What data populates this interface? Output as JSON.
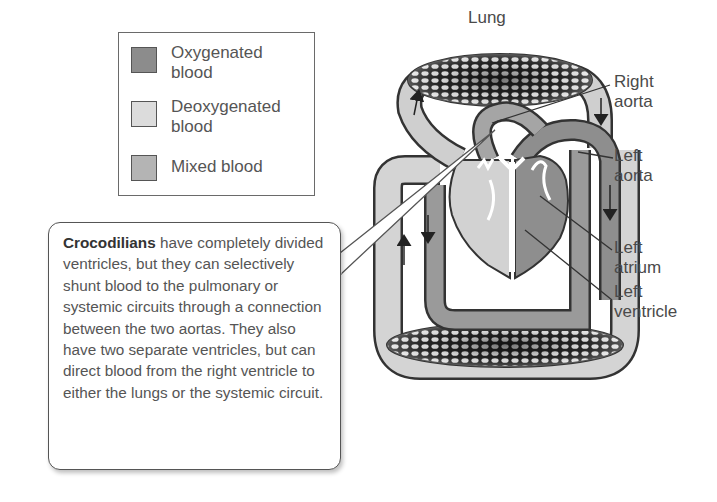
{
  "legend": {
    "items": [
      {
        "label": "Oxygenated blood",
        "line1": "Oxygenated",
        "line2": "blood",
        "color": "#8c8c8c"
      },
      {
        "label": "Deoxygenated blood",
        "line1": "Deoxygenated",
        "line2": "blood",
        "color": "#dcdcdc"
      },
      {
        "label": "Mixed blood",
        "line1": "Mixed blood",
        "line2": "",
        "color": "#b4b4b4"
      }
    ]
  },
  "diagram": {
    "lung_label": "Lung",
    "labels": {
      "right_aorta": {
        "line1": "Right",
        "line2": "aorta"
      },
      "left_aorta": {
        "line1": "Left",
        "line2": "aorta"
      },
      "left_atrium": {
        "line1": "Left",
        "line2": "atrium"
      },
      "left_ventricle": {
        "line1": "Left",
        "line2": "ventricle"
      }
    }
  },
  "callout": {
    "bold": "Crocodilians",
    "text": " have completely divided ventricles, but they can selectively shunt blood to the pulmonary or systemic circuits through a connection between the two aortas. They also have two separate ventricles, but can direct blood from the right ventricle to either the lungs or the systemic circuit."
  }
}
